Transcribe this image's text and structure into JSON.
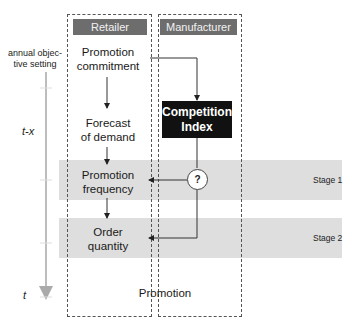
{
  "diagram": {
    "type": "process-flow",
    "columns": [
      {
        "id": "retailer",
        "label": "Retailer"
      },
      {
        "id": "manufacturer",
        "label": "Manufacturer"
      }
    ],
    "retailer_nodes": [
      {
        "id": "promotion_commitment",
        "label_line1": "Promotion",
        "label_line2": "commitment"
      },
      {
        "id": "forecast_of_demand",
        "label_line1": "Forecast",
        "label_line2": "of demand"
      },
      {
        "id": "promotion_frequency",
        "label_line1": "Promotion",
        "label_line2": "frequency"
      },
      {
        "id": "order_quantity",
        "label_line1": "Order",
        "label_line2": "quantity"
      }
    ],
    "manufacturer_nodes": [
      {
        "id": "competition_index",
        "label_line1": "Competition",
        "label_line2": "Index"
      },
      {
        "id": "decision",
        "label": "?"
      }
    ],
    "stages": [
      {
        "label": "Stage 1"
      },
      {
        "label": "Stage 2"
      }
    ],
    "footer_label": "Promotion",
    "timeline": {
      "start_label_line1": "annual objec-",
      "start_label_line2": "tive setting",
      "mid_label": "t-x",
      "end_label": "t"
    },
    "edges": [
      {
        "from": "promotion_commitment",
        "to": "forecast_of_demand"
      },
      {
        "from": "forecast_of_demand",
        "to": "promotion_frequency"
      },
      {
        "from": "promotion_frequency",
        "to": "order_quantity"
      },
      {
        "from": "promotion_commitment",
        "to": "competition_index"
      },
      {
        "from": "competition_index",
        "to": "decision"
      },
      {
        "from": "decision",
        "to": "promotion_frequency"
      },
      {
        "from": "decision",
        "to": "order_quantity"
      }
    ]
  },
  "colors": {
    "header_bg": "#6d6d6d",
    "band_bg": "#dedede",
    "competition_box_bg": "#111111",
    "timeline": "#bdbdbd"
  }
}
